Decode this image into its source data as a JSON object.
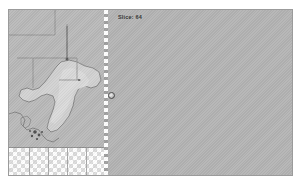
{
  "viewer": {
    "title": "slice-viewer",
    "background_color": "#ffffff"
  },
  "canvas": {
    "name": "slice-canvas",
    "background_color": "#b4b4b4",
    "border_color": "#9b9b9b",
    "width": 285,
    "height": 167
  },
  "overlay": {
    "slice_label": "Slice: 64",
    "label_color": "#2f2f2f"
  },
  "left_pane": {
    "name": "map-pane",
    "background_color": "#b9b9b9",
    "landmass_color": "#d2d2d2",
    "outline_color": "#6f6f6f",
    "region_line_color": "#8a8a8a"
  },
  "divider": {
    "name": "slice-divider",
    "style": "dashed",
    "color": "#ffffff"
  },
  "checkerboard": {
    "name": "transparency-checker",
    "light_color": "#ffffff",
    "dark_color": "#dcdcdc",
    "cell_size": 4
  },
  "right_pane": {
    "name": "empty-slice-pane",
    "background_color": "#b4b4b4"
  },
  "cursor": {
    "name": "cursor-marker",
    "x": 203,
    "y": 93,
    "color": "#4a4a4a"
  }
}
